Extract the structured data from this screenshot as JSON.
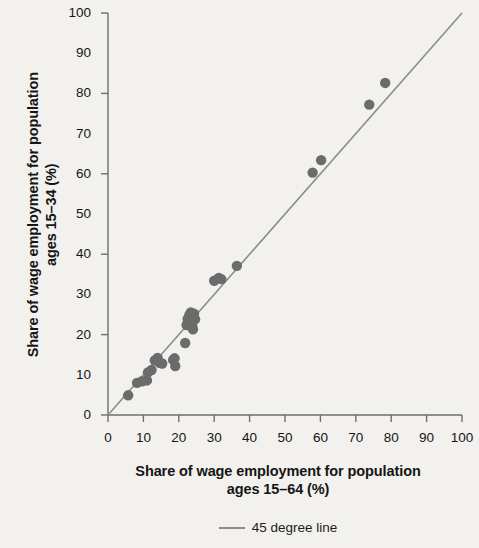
{
  "chart_data": {
    "type": "scatter",
    "title": "",
    "xlabel": "Share of wage employment for population ages 15–64 (%)",
    "xlabel_line1": "Share of wage employment for population",
    "xlabel_line2": "ages 15–64 (%)",
    "ylabel": "Share of wage employment for population ages 15–34 (%)",
    "ylabel_line1": "Share of wage employment for population",
    "ylabel_line2": "ages 15–34 (%)",
    "xlim": [
      0,
      100
    ],
    "ylim": [
      0,
      100
    ],
    "xticks": [
      0,
      10,
      20,
      30,
      40,
      50,
      60,
      70,
      80,
      90,
      100
    ],
    "yticks": [
      0,
      10,
      20,
      30,
      40,
      50,
      60,
      70,
      80,
      90,
      100
    ],
    "ytick_major": [
      0,
      20,
      40,
      60,
      80,
      100
    ],
    "grid": false,
    "legend_position": "bottom-center",
    "legend": [
      {
        "label": "45 degree line",
        "type": "line",
        "color": "#8c8c8c"
      }
    ],
    "reference_line": {
      "label": "45 degree line",
      "slope": 1,
      "intercept": 0,
      "from": [
        0,
        0
      ],
      "to": [
        100,
        100
      ],
      "color": "#8c8c8c"
    },
    "series": [
      {
        "name": "Countries",
        "marker": "circle",
        "color": "#6b6b6b",
        "points": [
          [
            5.7,
            4.9
          ],
          [
            8.2,
            8.0
          ],
          [
            9.6,
            8.4
          ],
          [
            11.0,
            8.6
          ],
          [
            11.3,
            10.6
          ],
          [
            12.3,
            11.2
          ],
          [
            13.2,
            13.6
          ],
          [
            14.0,
            14.2
          ],
          [
            14.6,
            13.0
          ],
          [
            15.3,
            12.8
          ],
          [
            18.4,
            13.7
          ],
          [
            18.8,
            14.1
          ],
          [
            19.0,
            12.2
          ],
          [
            21.8,
            17.9
          ],
          [
            22.2,
            22.4
          ],
          [
            22.5,
            23.9
          ],
          [
            23.0,
            24.9
          ],
          [
            23.4,
            25.5
          ],
          [
            23.6,
            23.6
          ],
          [
            23.8,
            22.1
          ],
          [
            24.0,
            21.3
          ],
          [
            24.3,
            25.2
          ],
          [
            24.6,
            23.8
          ],
          [
            30.0,
            33.4
          ],
          [
            31.3,
            34.1
          ],
          [
            32.0,
            33.8
          ],
          [
            36.4,
            37.1
          ],
          [
            57.8,
            60.3
          ],
          [
            60.2,
            63.4
          ],
          [
            73.8,
            77.2
          ],
          [
            78.3,
            82.6
          ]
        ]
      }
    ]
  },
  "axis": {
    "origin_px": {
      "x": 108,
      "y": 415
    },
    "x_end_px": 462,
    "y_end_px": 13,
    "color": "#6e6e6e"
  },
  "legend": {
    "label": "45 degree line",
    "swatch_name": "line-swatch"
  },
  "colors": {
    "background": "#f2f1ee",
    "marker": "#6b6b6b",
    "line": "#8c8c8c",
    "axis": "#6e6e6e",
    "text": "#151515"
  }
}
